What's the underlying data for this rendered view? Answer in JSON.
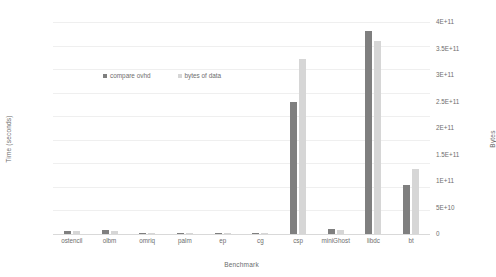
{
  "chart_data": {
    "type": "bar",
    "title": "",
    "xlabel": "Benchmark",
    "ylabel": "Time (seconds)",
    "y2label": "Bytes",
    "categories": [
      "ostencil",
      "olbm",
      "omriq",
      "palm",
      "ep",
      "cg",
      "csp",
      "miniGhost",
      "libdc",
      "bt"
    ],
    "series": [
      {
        "name": "compare ovhd",
        "axis": "left",
        "color": "#7f7f7f",
        "values": [
          7.0,
          9.0,
          0.6,
          1.0,
          0.4,
          2.0,
          280.0,
          10.0,
          430.0,
          105.0
        ]
      },
      {
        "name": "bytes of data",
        "axis": "right",
        "color": "#d6d6d6",
        "values": [
          5000000000.0,
          6000000000.0,
          400000000.0,
          700000000.0,
          300000000.0,
          1500000000.0,
          330000000000.0,
          8000000000.0,
          365000000000.0,
          122000000000.0
        ]
      }
    ],
    "ylim": [
      0,
      450
    ],
    "y2lim": [
      0,
      400000000000
    ],
    "yticks": [
      "0.00",
      "50.00",
      "100.00",
      "150.00",
      "200.00",
      "250.00",
      "300.00",
      "350.00",
      "400.00",
      "450.00"
    ],
    "ytick_values": [
      0,
      50,
      100,
      150,
      200,
      250,
      300,
      350,
      400,
      450
    ],
    "y2ticks": [
      "0",
      "5E+10",
      "1E+11",
      "1.5E+11",
      "2E+11",
      "2.5E+11",
      "3E+11",
      "3.5E+11",
      "4E+11"
    ],
    "y2tick_values": [
      0,
      50000000000,
      100000000000,
      150000000000,
      200000000000,
      250000000000,
      300000000000,
      350000000000,
      400000000000
    ],
    "grid": true,
    "legend_position": "inside-upper-left"
  },
  "legend": {
    "items": [
      {
        "label": "compare ovhd",
        "color": "#7f7f7f"
      },
      {
        "label": "bytes of data",
        "color": "#d6d6d6"
      }
    ]
  }
}
